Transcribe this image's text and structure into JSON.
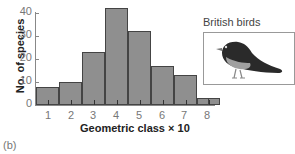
{
  "chart_data": {
    "type": "bar",
    "title": "",
    "xlabel": "Geometric class × 10",
    "ylabel": "No. of species",
    "categories": [
      "1",
      "2",
      "3",
      "4",
      "5",
      "6",
      "7",
      "8"
    ],
    "values": [
      8,
      10,
      23,
      42,
      32,
      17,
      13,
      3
    ],
    "ylim": [
      0,
      40
    ],
    "yticks": [
      "0",
      "10",
      "20",
      "30",
      "40"
    ],
    "grid": false,
    "legend": null,
    "annotations": [
      "British birds"
    ],
    "panel_label": "(b)",
    "bar_color": "#8f8f8f"
  }
}
